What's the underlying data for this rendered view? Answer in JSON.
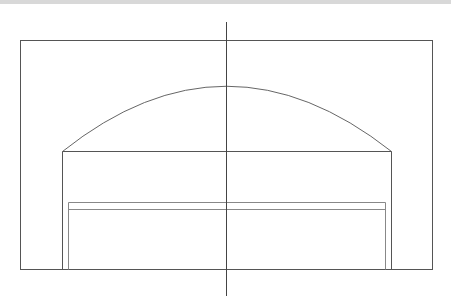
{
  "diagram": {
    "type": "architectural-elevation-line-drawing",
    "stroke_color": "#555555",
    "inner_stroke_color": "#888888",
    "background": "#ffffff",
    "elements": {
      "outer_frame": {
        "x1": 20,
        "y1": 40,
        "x2": 433,
        "y2": 269
      },
      "center_axis": {
        "x": 226,
        "y1": 22,
        "y2": 296
      },
      "arch": {
        "x1": 62,
        "y": 151,
        "x2": 391,
        "peak_y": 86
      },
      "inner_frame": {
        "x1": 62,
        "y1": 151,
        "x2": 391,
        "y2": 269
      },
      "opening": {
        "x1": 68,
        "y1": 202,
        "x2": 385,
        "y2": 269,
        "lintel_y": 209
      }
    }
  }
}
